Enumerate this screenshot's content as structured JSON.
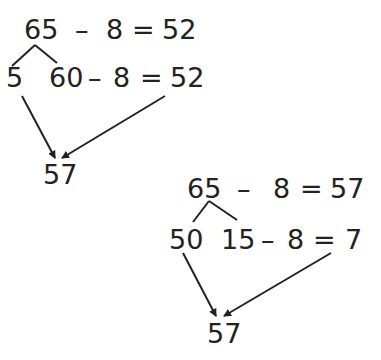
{
  "diagram": {
    "strategy_a": {
      "top_equation": {
        "minuend": "65",
        "operator": "–",
        "subtrahend": "8",
        "equals": "=",
        "result": "52"
      },
      "split": {
        "left": "5",
        "right": "60"
      },
      "sub_equation": {
        "operator": "–",
        "subtrahend": "8",
        "equals": "=",
        "result": "52"
      },
      "final": "57"
    },
    "strategy_b": {
      "top_equation": {
        "minuend": "65",
        "operator": "–",
        "subtrahend": "8",
        "equals": "=",
        "result": "57"
      },
      "split": {
        "left": "50",
        "right": "15"
      },
      "sub_equation": {
        "operator": "–",
        "subtrahend": "8",
        "equals": "=",
        "result": "7"
      },
      "final": "57"
    },
    "colors": {
      "ink": "#222222",
      "background": "#ffffff"
    }
  }
}
